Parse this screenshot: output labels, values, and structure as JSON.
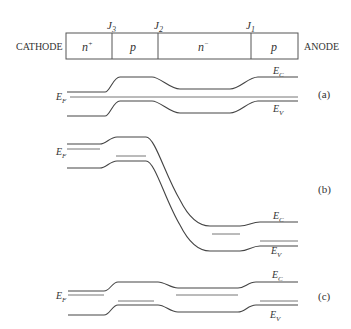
{
  "device": {
    "left_terminal": "CATHODE",
    "right_terminal": "ANODE",
    "regions": [
      {
        "label": "n",
        "sup": "+"
      },
      {
        "label": "p",
        "sup": ""
      },
      {
        "label": "n",
        "sup": "−"
      },
      {
        "label": "p",
        "sup": ""
      }
    ],
    "junctions": [
      {
        "label": "J",
        "sub": "3"
      },
      {
        "label": "J",
        "sub": "2"
      },
      {
        "label": "J",
        "sub": "1"
      }
    ]
  },
  "panels": [
    {
      "id": "a",
      "label": "(a)",
      "ec_label": "E",
      "ec_sub": "C",
      "ev_label": "E",
      "ev_sub": "V",
      "ef_label": "E",
      "ef_sub": "F"
    },
    {
      "id": "b",
      "label": "(b)",
      "ec_label": "E",
      "ec_sub": "C",
      "ev_label": "E",
      "ev_sub": "V",
      "ef_label": "E",
      "ef_sub": "F"
    },
    {
      "id": "c",
      "label": "(c)",
      "ec_label": "E",
      "ec_sub": "C",
      "ev_label": "E",
      "ev_sub": "V",
      "ef_label": "E",
      "ef_sub": "F"
    }
  ]
}
